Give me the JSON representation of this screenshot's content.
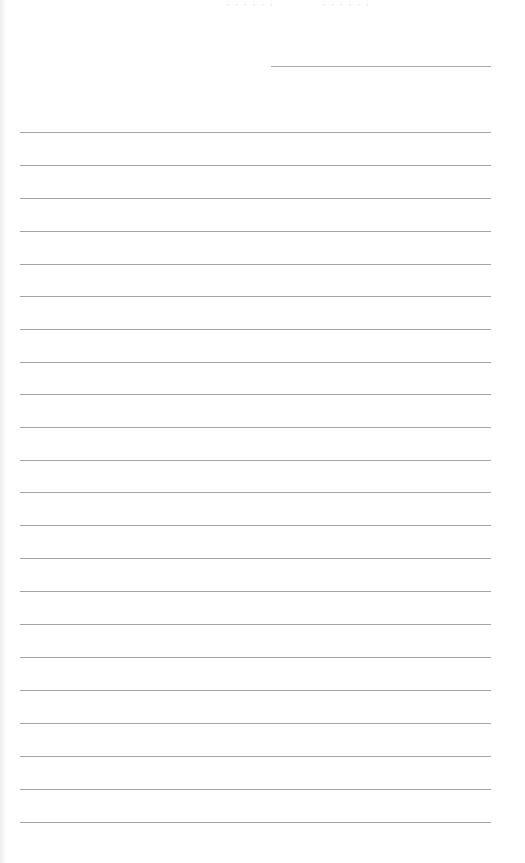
{
  "page": {
    "type": "lined-writing-sheet",
    "background_color": "#ffffff",
    "line_color": "#a4a4a4"
  },
  "header": {
    "name_line": {
      "label": ""
    },
    "bleed_through": [
      "· · · · · ·",
      "· · · · · ·"
    ]
  },
  "lines": {
    "count": 22,
    "values": [
      "",
      "",
      "",
      "",
      "",
      "",
      "",
      "",
      "",
      "",
      "",
      "",
      "",
      "",
      "",
      "",
      "",
      "",
      "",
      "",
      "",
      ""
    ]
  }
}
